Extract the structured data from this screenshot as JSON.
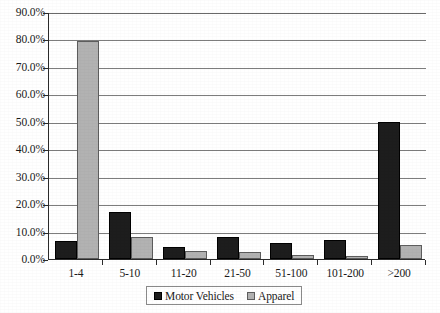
{
  "chart_data": {
    "type": "bar",
    "title": "",
    "xlabel": "",
    "ylabel": "",
    "categories": [
      "1-4",
      "5-10",
      "11-20",
      "21-50",
      "51-100",
      "101-200",
      ">200"
    ],
    "series": [
      {
        "name": "Motor Vehicles",
        "color": "#1d1d1d",
        "values": [
          6.5,
          17.0,
          4.5,
          8.0,
          6.0,
          7.0,
          50.0
        ]
      },
      {
        "name": "Apparel",
        "color": "#b2b2b2",
        "values": [
          79.5,
          8.0,
          3.0,
          2.5,
          1.5,
          1.0,
          5.0
        ]
      }
    ],
    "ylim": [
      0,
      90
    ],
    "ytick_values": [
      0,
      10,
      20,
      30,
      40,
      50,
      60,
      70,
      80,
      90
    ],
    "ytick_labels": [
      "0.0%",
      "10.0%",
      "20.0%",
      "30.0%",
      "40.0%",
      "50.0%",
      "60.0%",
      "70.0%",
      "80.0%",
      "90.0%"
    ],
    "grid": true,
    "legend_position": "bottom-center",
    "legend_entries": [
      "Motor Vehicles",
      "Apparel"
    ]
  }
}
